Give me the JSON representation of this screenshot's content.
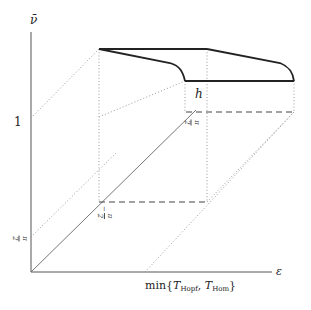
{
  "axes": {
    "y_label": "ν̄",
    "x_label": "ε",
    "y_tick_1": "1",
    "x_tick_label_prefix": "min{",
    "x_tick_T1": "T",
    "x_tick_T1_sub": "Hopf",
    "x_tick_sep": ", ",
    "x_tick_T2": "T",
    "x_tick_T2_sub": "Hom",
    "x_tick_label_suffix": "}"
  },
  "labels": {
    "h": "h",
    "frac_pi_upper_num": "π",
    "frac_pi_upper_den": "2",
    "frac_minus_pi_num": "π",
    "frac_minus_pi_den": "2",
    "frac_minus_sign": "−",
    "frac_pi_axis_num": "π",
    "frac_pi_axis_den": "2"
  },
  "colors": {
    "axis": "#555555",
    "thick_curve": "#222222",
    "dotted": "#999999",
    "dashed": "#444444"
  }
}
